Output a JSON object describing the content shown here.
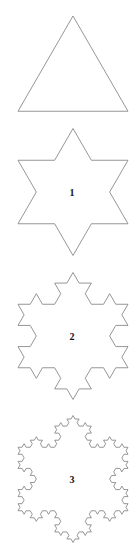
{
  "colors": {
    "stroke": "#8a8a8a",
    "label": "#111111",
    "background": "#ffffff"
  },
  "side_length": 110,
  "figures": [
    {
      "level": 0,
      "label": "",
      "cx": 73,
      "cy": 79.5
    },
    {
      "level": 1,
      "label": "1",
      "cx": 73,
      "cy": 192
    },
    {
      "level": 2,
      "label": "2",
      "cx": 73,
      "cy": 336
    },
    {
      "level": 3,
      "label": "3",
      "cx": 73,
      "cy": 479
    }
  ]
}
